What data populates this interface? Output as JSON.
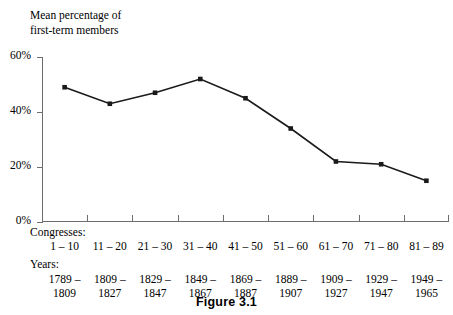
{
  "chart_data": {
    "type": "line",
    "title": "",
    "ylabel": "Mean percentage of\nfirst-term members",
    "xlabel": "",
    "ylim": [
      0,
      60
    ],
    "yticks": [
      0,
      20,
      40,
      60
    ],
    "ytick_labels": [
      "0%",
      "20%",
      "40%",
      "60%"
    ],
    "grid": false,
    "legend": "none",
    "marker": "square",
    "line_color": "#1a1a1a",
    "axis_color": "#6d6d6d",
    "categories": [
      "1 – 10",
      "11 – 20",
      "21 – 30",
      "31 – 40",
      "41 – 50",
      "51 – 60",
      "61 – 70",
      "71 – 80",
      "81 – 89"
    ],
    "category_heading": "Congresses:",
    "secondary_heading": "Years:",
    "year_ranges": [
      {
        "start": "1789 –",
        "end": "1809"
      },
      {
        "start": "1809 –",
        "end": "1827"
      },
      {
        "start": "1829 –",
        "end": "1847"
      },
      {
        "start": "1849 –",
        "end": "1867"
      },
      {
        "start": "1869 –",
        "end": "1887"
      },
      {
        "start": "1889 –",
        "end": "1907"
      },
      {
        "start": "1909 –",
        "end": "1927"
      },
      {
        "start": "1929 –",
        "end": "1947"
      },
      {
        "start": "1949 –",
        "end": "1965"
      }
    ],
    "values": [
      49,
      43,
      47,
      52,
      45,
      34,
      22,
      21,
      15
    ]
  },
  "caption": {
    "text": "Figure 3.1"
  }
}
